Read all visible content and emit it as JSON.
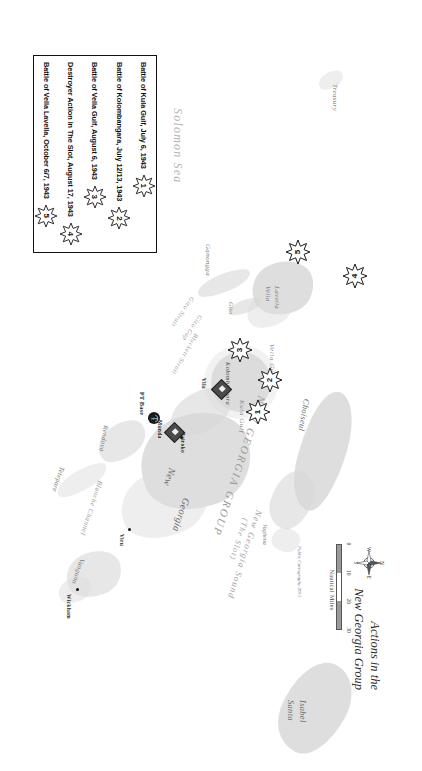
{
  "map": {
    "title_line1": "Actions in the",
    "title_line2": "New Georgia Group",
    "credit": "Public Cartography 2015",
    "scale": {
      "unit_label": "Nautical Miles",
      "ticks": [
        "0",
        "10",
        "20",
        "30"
      ]
    },
    "compass": {
      "n": "N",
      "e": "E",
      "s": "S",
      "w": "W"
    }
  },
  "legend": {
    "entries": [
      {
        "num": "1",
        "label": "Battle of Kula Gulf, July 6, 1943"
      },
      {
        "num": "2",
        "label": "Battle of Kolombangara, July 12/13, 1943"
      },
      {
        "num": "3",
        "label": "Battle of Vella Gulf, August 6, 1943"
      },
      {
        "num": "4",
        "label": "Destroyer Action in The Slot, August 17, 1943"
      },
      {
        "num": "5",
        "label": "Battle of Vella Lavella, October 6/7, 1943"
      }
    ]
  },
  "battle_markers": [
    {
      "num": "1"
    },
    {
      "num": "2"
    },
    {
      "num": "3"
    },
    {
      "num": "4"
    },
    {
      "num": "5"
    }
  ],
  "bases": [
    {
      "label": "PT Base"
    },
    {
      "label": "Munda"
    },
    {
      "label": "Vila"
    }
  ],
  "labels": {
    "seas": [
      {
        "text": "Solomon Sea"
      },
      {
        "text": "New Georgia Sound"
      },
      {
        "text": "(The Slot)"
      }
    ],
    "regions": [
      {
        "text": "NEW GEORGIA GROUP"
      }
    ],
    "islands": [
      {
        "text": "Treasury"
      },
      {
        "text": "Ganongga"
      },
      {
        "text": "Gizo"
      },
      {
        "text": "Vella"
      },
      {
        "text": "Lavella"
      },
      {
        "text": "Kolombangara"
      },
      {
        "text": "New"
      },
      {
        "text": "Georgia"
      },
      {
        "text": "Tetepare"
      },
      {
        "text": "Vangunu"
      },
      {
        "text": "Choiseul"
      },
      {
        "text": "Vaghena"
      },
      {
        "text": "Santa"
      },
      {
        "text": "Isabel"
      },
      {
        "text": "Rendova"
      }
    ],
    "waters": [
      {
        "text": "Gizo Strait"
      },
      {
        "text": "Gizo Gap"
      },
      {
        "text": "Blackett Strait"
      },
      {
        "text": "Vella Gulf"
      },
      {
        "text": "Kula Gulf"
      },
      {
        "text": "Blanche Channel"
      }
    ],
    "towns": [
      {
        "text": "Bairoko"
      },
      {
        "text": "Viru"
      },
      {
        "text": "Wickham"
      }
    ]
  }
}
